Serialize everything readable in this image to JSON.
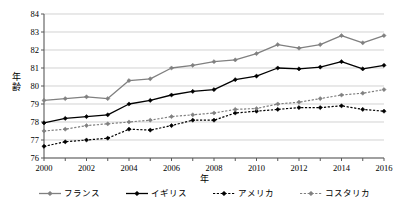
{
  "chart_data": {
    "type": "line",
    "title": "",
    "xlabel": "年",
    "ylabel": "年齢",
    "xlim": [
      2000,
      2016
    ],
    "ylim": [
      76,
      84
    ],
    "grid": true,
    "legend_position": "bottom",
    "x": [
      2000,
      2001,
      2002,
      2003,
      2004,
      2005,
      2006,
      2007,
      2008,
      2009,
      2010,
      2011,
      2012,
      2013,
      2014,
      2015,
      2016
    ],
    "x_tick_labels": [
      "2000",
      "2002",
      "2004",
      "2006",
      "2008",
      "2010",
      "2012",
      "2014",
      "2016"
    ],
    "y_tick_labels": [
      "76",
      "77",
      "78",
      "79",
      "80",
      "81",
      "82",
      "83",
      "84"
    ],
    "series": [
      {
        "name": "フランス",
        "color": "#808080",
        "dash": "solid",
        "marker": "diamond",
        "values": [
          79.2,
          79.3,
          79.4,
          79.3,
          80.3,
          80.4,
          81.0,
          81.15,
          81.35,
          81.45,
          81.8,
          82.3,
          82.1,
          82.3,
          82.8,
          82.4,
          82.8
        ]
      },
      {
        "name": "イギリス",
        "color": "#000000",
        "dash": "solid",
        "marker": "diamond",
        "values": [
          77.95,
          78.2,
          78.3,
          78.4,
          79.0,
          79.2,
          79.5,
          79.7,
          79.8,
          80.35,
          80.55,
          81.0,
          80.95,
          81.05,
          81.35,
          80.95,
          81.15
        ]
      },
      {
        "name": "アメリカ",
        "color": "#000000",
        "dash": "dotted",
        "marker": "diamond",
        "values": [
          76.65,
          76.9,
          77.0,
          77.1,
          77.6,
          77.55,
          77.8,
          78.1,
          78.1,
          78.5,
          78.6,
          78.7,
          78.8,
          78.8,
          78.9,
          78.7,
          78.6
        ]
      },
      {
        "name": "コスタリカ",
        "color": "#808080",
        "dash": "dotted",
        "marker": "diamond",
        "values": [
          77.5,
          77.6,
          77.8,
          77.9,
          78.0,
          78.1,
          78.3,
          78.4,
          78.5,
          78.7,
          78.75,
          79.0,
          79.1,
          79.3,
          79.5,
          79.6,
          79.8
        ]
      }
    ]
  },
  "axes": {
    "y_title": "年齢",
    "y_title_chars": [
      "年",
      "齢"
    ],
    "x_title": "年"
  },
  "legend": {
    "items": [
      {
        "label": "フランス"
      },
      {
        "label": "イギリス"
      },
      {
        "label": "アメリカ"
      },
      {
        "label": "コスタリカ"
      }
    ]
  },
  "colors": {
    "gray_series": "#808080",
    "black_series": "#000000",
    "gridline": "#bfbfbf",
    "axis": "#595959",
    "background": "#ffffff"
  }
}
